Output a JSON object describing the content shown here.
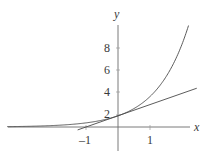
{
  "figure": {
    "background_color": "#ffffff",
    "line_color": "#4a4a4a",
    "axis_color": "#6b6b6b",
    "text_color": "#3a3a3a",
    "width": 212,
    "height": 157
  },
  "axes": {
    "x_axis_label": "x",
    "y_axis_label": "y",
    "origin_px": {
      "x": 118,
      "y": 127
    },
    "x_unit_px": 32,
    "y_unit_px": 11.2
  },
  "chart_data": {
    "type": "line",
    "title": "",
    "subtitle": "",
    "xlabel": "x",
    "ylabel": "y",
    "xlim": [
      -3.45,
      2.6
    ],
    "ylim": [
      -2.7,
      9.9
    ],
    "grid": false,
    "legend": null,
    "x_ticks": [
      -1,
      1
    ],
    "x_tick_labels": [
      "–1",
      "1"
    ],
    "y_ticks": [
      2,
      4,
      6,
      8
    ],
    "y_tick_labels": [
      "2",
      "4",
      "6",
      "8"
    ],
    "series": [
      {
        "name": "exponential-curve",
        "equation": "y = e^x",
        "style": "solid",
        "x": [
          -3.45,
          -3.0,
          -2.5,
          -2.0,
          -1.5,
          -1.0,
          -0.5,
          0.0,
          0.25,
          0.5,
          0.75,
          1.0,
          1.25,
          1.5,
          1.75,
          2.0,
          2.2
        ],
        "y": [
          0.032,
          0.05,
          0.082,
          0.135,
          0.223,
          0.368,
          0.607,
          1.0,
          1.284,
          1.649,
          2.117,
          2.718,
          3.49,
          4.482,
          5.755,
          7.389,
          9.025
        ]
      },
      {
        "name": "tangent-line",
        "equation": "y = x + 1",
        "style": "solid",
        "x": [
          -1.25,
          2.45
        ],
        "y": [
          -0.25,
          3.45
        ]
      }
    ],
    "annotations": [
      {
        "text": "y",
        "role": "y-axis-name",
        "x_px": 118,
        "y_px": 14
      },
      {
        "text": "x",
        "role": "x-axis-name",
        "x_px": 197,
        "y_px": 128
      }
    ]
  }
}
